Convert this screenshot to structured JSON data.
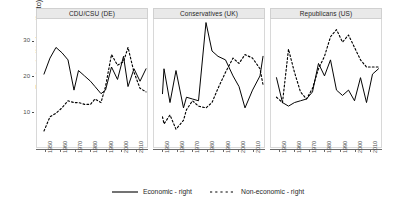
{
  "chart_data": {
    "type": "line",
    "title": "",
    "xlabel": "",
    "ylabel": "Emphasis (% of manifesto)",
    "xlim": [
      1945,
      2017
    ],
    "ylim": [
      0,
      36
    ],
    "xticks": [
      1950,
      1960,
      1970,
      1980,
      1990,
      2000,
      2010
    ],
    "xticklabels": [
      "1950",
      "1960",
      "1970",
      "1980",
      "1990",
      "2000",
      "2010"
    ],
    "yticks": [
      10,
      20,
      30
    ],
    "yticklabels": [
      "10",
      "20",
      "30"
    ],
    "grid": false,
    "legend_position": "bottom",
    "facets": [
      {
        "label": "CDU/CSU (DE)",
        "series": [
          {
            "name": "Economic - right",
            "style": "solid",
            "x": [
              1949,
              1953,
              1957,
              1961,
              1965,
              1969,
              1972,
              1976,
              1980,
              1983,
              1987,
              1990,
              1994,
              1998,
              2002,
              2005,
              2009,
              2013,
              2017
            ],
            "y": [
              20.5,
              25.0,
              28.0,
              26.5,
              24.5,
              16.0,
              21.5,
              20.0,
              18.5,
              17.0,
              15.0,
              16.0,
              22.5,
              19.0,
              25.5,
              17.0,
              22.0,
              18.5,
              22.0,
              20.0
            ]
          },
          {
            "name": "Non-economic - right",
            "style": "dotted",
            "x": [
              1949,
              1953,
              1957,
              1961,
              1965,
              1969,
              1972,
              1976,
              1980,
              1983,
              1987,
              1990,
              1994,
              1998,
              2002,
              2005,
              2009,
              2013,
              2017
            ],
            "y": [
              4.5,
              8.5,
              9.5,
              11.0,
              13.0,
              12.5,
              12.5,
              12.0,
              12.0,
              13.5,
              12.5,
              17.0,
              26.0,
              23.0,
              24.0,
              28.0,
              21.0,
              16.5,
              15.5,
              20.0
            ]
          }
        ]
      },
      {
        "label": "Conservatives (UK)",
        "series": [
          {
            "name": "Economic - right",
            "style": "solid",
            "x": [
              1950,
              1951,
              1955,
              1959,
              1964,
              1966,
              1970,
              1974,
              1979,
              1983,
              1987,
              1992,
              1997,
              2001,
              2005,
              2010,
              2015,
              2017
            ],
            "y": [
              15.0,
              22.0,
              12.5,
              21.5,
              11.0,
              14.0,
              13.5,
              13.0,
              35.0,
              27.0,
              25.5,
              24.5,
              20.0,
              17.0,
              11.0,
              16.0,
              20.0,
              25.5
            ]
          },
          {
            "name": "Non-economic - right",
            "style": "dotted",
            "x": [
              1950,
              1951,
              1955,
              1959,
              1964,
              1966,
              1970,
              1974,
              1979,
              1983,
              1987,
              1992,
              1997,
              2001,
              2005,
              2010,
              2015,
              2017
            ],
            "y": [
              8.5,
              6.5,
              9.0,
              5.0,
              7.5,
              10.5,
              13.0,
              11.5,
              11.0,
              12.5,
              16.5,
              21.0,
              25.0,
              23.5,
              26.0,
              25.0,
              22.0,
              17.5,
              16.5
            ]
          }
        ]
      },
      {
        "label": "Republicans (US)",
        "series": [
          {
            "name": "Economic - right",
            "style": "solid",
            "x": [
              1948,
              1952,
              1956,
              1960,
              1964,
              1968,
              1972,
              1976,
              1980,
              1984,
              1988,
              1992,
              1996,
              2000,
              2004,
              2008,
              2012,
              2016
            ],
            "y": [
              19.5,
              12.5,
              11.5,
              12.5,
              13.0,
              13.5,
              15.5,
              23.5,
              20.0,
              24.5,
              16.0,
              14.5,
              16.0,
              13.0,
              19.5,
              12.5,
              20.5,
              22.0
            ]
          },
          {
            "name": "Non-economic - right",
            "style": "dotted",
            "x": [
              1948,
              1952,
              1956,
              1960,
              1964,
              1968,
              1972,
              1976,
              1980,
              1984,
              1988,
              1992,
              1996,
              2000,
              2004,
              2008,
              2012,
              2016
            ],
            "y": [
              14.0,
              12.5,
              27.5,
              21.0,
              15.5,
              13.5,
              16.5,
              22.0,
              25.5,
              31.0,
              33.0,
              29.5,
              31.5,
              28.0,
              24.5,
              22.5,
              22.5,
              22.5
            ]
          }
        ]
      }
    ],
    "legend": [
      {
        "label": "Economic - right",
        "style": "solid",
        "color": "#000000"
      },
      {
        "label": "Non-economic - right",
        "style": "dotted",
        "color": "#000000"
      }
    ]
  }
}
